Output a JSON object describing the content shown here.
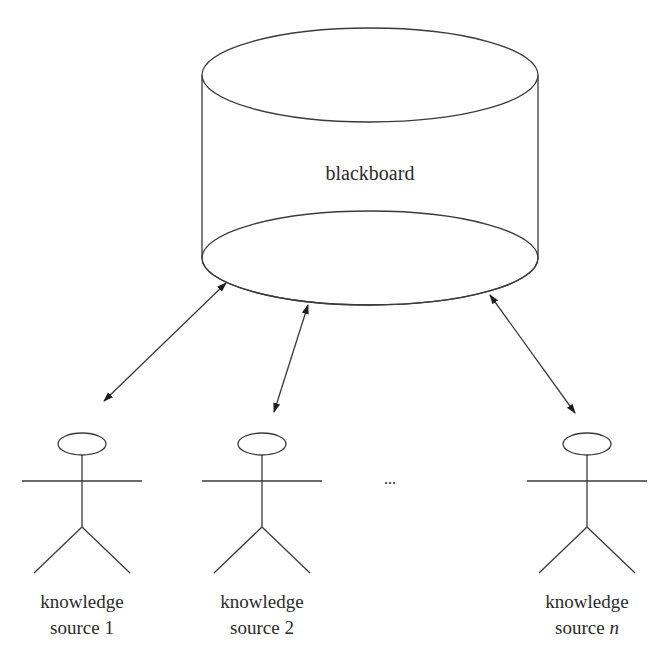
{
  "blackboard": {
    "label": "blackboard"
  },
  "ellipsis": "...",
  "knowledge_sources": [
    {
      "line1": "knowledge",
      "line2_prefix": "source ",
      "line2_index": "1",
      "index_italic": false
    },
    {
      "line1": "knowledge",
      "line2_prefix": "source ",
      "line2_index": "2",
      "index_italic": false
    },
    {
      "line1": "knowledge",
      "line2_prefix": "source ",
      "line2_index": "n",
      "index_italic": true
    }
  ],
  "connections": [
    {
      "from": "blackboard",
      "to": "knowledge source 1",
      "direction": "bidirectional"
    },
    {
      "from": "blackboard",
      "to": "knowledge source 2",
      "direction": "bidirectional"
    },
    {
      "from": "blackboard",
      "to": "knowledge source n",
      "direction": "bidirectional"
    }
  ],
  "colors": {
    "line": "#3a3a3a",
    "text": "#2a2a2a",
    "background": "#ffffff"
  }
}
